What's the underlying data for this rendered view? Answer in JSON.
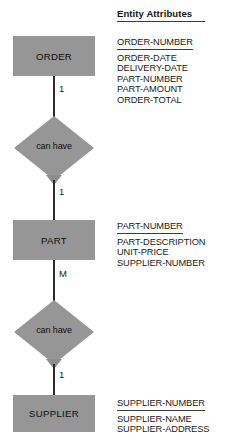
{
  "diagram": {
    "type": "entity-relationship-diagram",
    "background_color": "#ffffff",
    "shape_fill_color": "#969696",
    "line_color": "#2b2b2b",
    "text_color": "#1a1a1a",
    "attributes_header": "Entity Attributes",
    "entities": [
      {
        "name": "ORDER",
        "key_attribute": "ORDER-NUMBER",
        "attributes": [
          "ORDER-DATE",
          "DELIVERY-DATE",
          "PART-NUMBER",
          "PART-AMOUNT",
          "ORDER-TOTAL"
        ]
      },
      {
        "name": "PART",
        "key_attribute": "PART-NUMBER",
        "attributes": [
          "PART-DESCRIPTION",
          "UNIT-PRICE",
          "SUPPLIER-NUMBER"
        ]
      },
      {
        "name": "SUPPLIER",
        "key_attribute": "SUPPLIER-NUMBER",
        "attributes": [
          "SUPPLIER-NAME",
          "SUPPLIER-ADDRESS"
        ]
      }
    ],
    "relationships": [
      {
        "label": "can have",
        "from_entity": "ORDER",
        "to_entity": "PART",
        "from_cardinality": "1",
        "to_cardinality": "1"
      },
      {
        "label": "can have",
        "from_entity": "PART",
        "to_entity": "SUPPLIER",
        "from_cardinality": "M",
        "to_cardinality": "1"
      }
    ]
  }
}
